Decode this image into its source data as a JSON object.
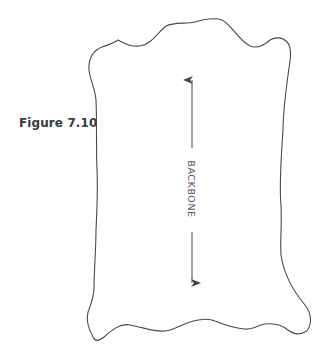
{
  "figure": {
    "label": "Figure 7.10"
  },
  "diagram": {
    "shape": "hide-outline",
    "axis": {
      "label": "BACKBONE",
      "orientation": "vertical",
      "arrowheads": "both-ends",
      "text_rotation_deg": 90
    },
    "colors": {
      "outline": "#4a4a4a",
      "arrow": "#4a4a4a",
      "text": "#555555",
      "label": "#3a3a3a",
      "background": "#ffffff"
    }
  }
}
